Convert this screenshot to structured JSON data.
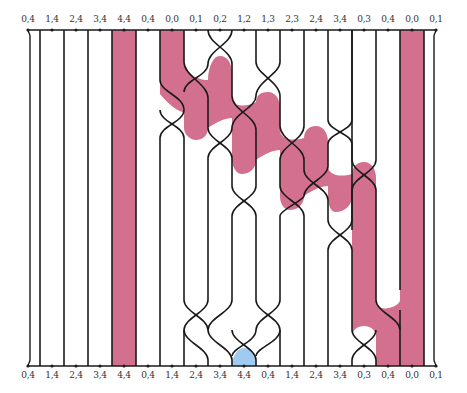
{
  "diagram": {
    "type": "strand crossing diagram",
    "colors": {
      "line": "#1a1a1a",
      "pink_region": "#d4708f",
      "blue_region": "#9ecbef",
      "background": "#ffffff"
    },
    "top_labels": [
      "0,4",
      "1,4",
      "2,4",
      "3,4",
      "4,4",
      "0,4",
      "0,0",
      "0,1",
      "0,2",
      "1,2",
      "1,3",
      "2,3",
      "2,4",
      "3,4",
      "0,3",
      "0,4",
      "0,0",
      "0,1"
    ],
    "bottom_labels": [
      "0,4",
      "1,4",
      "2,4",
      "3,4",
      "4,4",
      "0,4",
      "1,4",
      "2,4",
      "3,4",
      "4,4",
      "0,4",
      "1,4",
      "2,4",
      "3,4",
      "0,3",
      "0,4",
      "0,0",
      "0,1"
    ],
    "label_x": [
      28,
      52,
      76,
      100,
      124,
      148,
      172,
      196,
      220,
      244,
      268,
      292,
      316,
      340,
      364,
      388,
      412,
      436
    ]
  }
}
